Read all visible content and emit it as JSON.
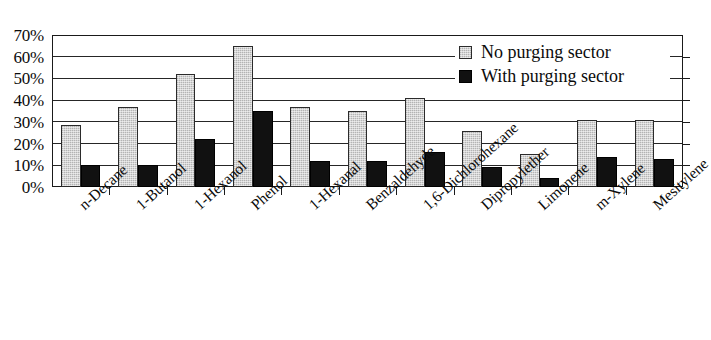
{
  "chart_data": {
    "type": "bar",
    "title": "",
    "xlabel": "",
    "ylabel": "",
    "ylim": [
      0,
      70
    ],
    "ytick_labels": [
      "0%",
      "10%",
      "20%",
      "30%",
      "40%",
      "50%",
      "60%",
      "70%"
    ],
    "ytick_values": [
      0,
      10,
      20,
      30,
      40,
      50,
      60,
      70
    ],
    "grid": true,
    "legend_position": "top-right",
    "categories": [
      "n-Decane",
      "1-Butanol",
      "1-Hexanol",
      "Phenol",
      "1-Hexanal",
      "Benzaldehyde",
      "1,6-Dichlorohexane",
      "Dipropylether",
      "Limonene",
      "m-Xylene",
      "Mesitylene"
    ],
    "series": [
      {
        "name": "No purging sector",
        "color": "#d4d4d4",
        "values": [
          28.5,
          37,
          52,
          65,
          37,
          35,
          41,
          26,
          15,
          31,
          31
        ]
      },
      {
        "name": "With purging sector",
        "color": "#111111",
        "values": [
          10,
          10,
          22,
          35,
          12,
          12,
          16,
          9,
          4,
          14,
          13
        ]
      }
    ]
  },
  "legend": {
    "items": [
      {
        "label": "No purging sector",
        "swatch": "light-gray-square"
      },
      {
        "label": "With purging sector",
        "swatch": "black-square"
      }
    ]
  }
}
